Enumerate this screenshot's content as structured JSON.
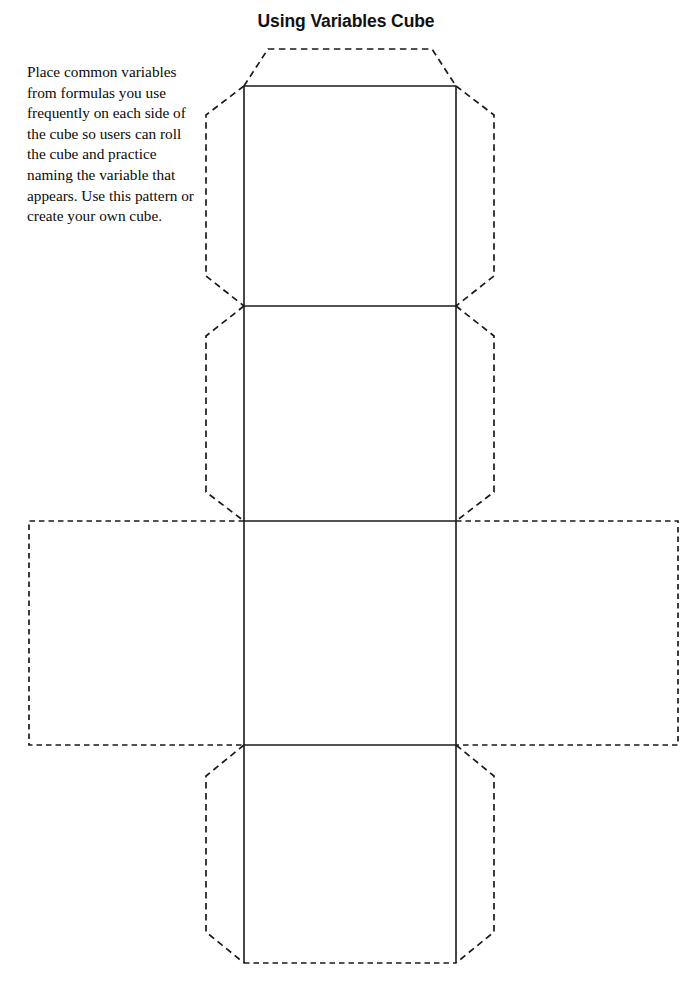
{
  "document": {
    "title": "Using Variables Cube",
    "page_width": 692,
    "page_height": 989,
    "background_color": "#ffffff",
    "ink_color": "#1a1a1a"
  },
  "instructions": {
    "text": "Place common variables from formulas you use frequently on each side of the cube so users can roll the cube and practice naming the variable that appears. Use this pattern or create your own cube.",
    "lines": [
      "Place common",
      "variables from formulas",
      "you use frequently",
      "on each side of the",
      "cube so users can roll",
      "the cube and practice",
      "naming the variable",
      "that appears. Use this",
      "pattern or create your",
      "own cube."
    ]
  },
  "cube_net": {
    "description": "Cross-shaped cube net template with solid fold lines and dashed glue tabs",
    "column_left_x": 244,
    "column_right_x": 456,
    "face_size": 212,
    "row_boundaries_y": [
      86,
      306,
      521,
      745,
      963
    ],
    "faces": [
      {
        "name": "face-top",
        "x": 244,
        "y": 86,
        "width": 212,
        "height": 220
      },
      {
        "name": "face-front",
        "x": 244,
        "y": 306,
        "width": 212,
        "height": 215
      },
      {
        "name": "face-bottom",
        "x": 244,
        "y": 521,
        "width": 212,
        "height": 224
      },
      {
        "name": "face-back",
        "x": 244,
        "y": 745,
        "width": 212,
        "height": 218
      },
      {
        "name": "face-left-flap",
        "x": 29,
        "y": 521,
        "width": 215,
        "height": 224
      },
      {
        "name": "face-right-flap",
        "x": 456,
        "y": 521,
        "width": 222,
        "height": 224
      }
    ],
    "tabs": [
      {
        "name": "tab-top",
        "style": "trapezoid-dashed"
      },
      {
        "name": "tab-upper-left",
        "style": "trapezoid-dashed"
      },
      {
        "name": "tab-upper-right",
        "style": "trapezoid-dashed"
      },
      {
        "name": "tab-middle-left",
        "style": "trapezoid-dashed"
      },
      {
        "name": "tab-middle-right",
        "style": "trapezoid-dashed"
      },
      {
        "name": "tab-lower-left",
        "style": "trapezoid-dashed"
      },
      {
        "name": "tab-lower-right",
        "style": "trapezoid-dashed"
      },
      {
        "name": "tab-bottom-edge",
        "style": "straight-dashed"
      }
    ],
    "line_styles": {
      "fold_line": "solid",
      "cut_tab_line": "dashed"
    }
  }
}
